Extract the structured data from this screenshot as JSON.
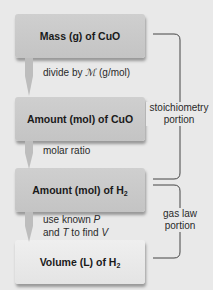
{
  "diagram": {
    "boxes": [
      {
        "label": "Mass (g) of CuO",
        "style": "dark"
      },
      {
        "label": "Amount (mol) of CuO",
        "style": "dark"
      },
      {
        "label_main": "Amount (mol) of H",
        "label_sub": "2",
        "style": "dark"
      },
      {
        "label_main": "Volume (L) of H",
        "label_sub": "2",
        "style": "light"
      }
    ],
    "steps": [
      {
        "text_pre": "divide by ",
        "symbol": "ℳ",
        "text_post": " (g/mol)"
      },
      {
        "text": "molar ratio"
      },
      {
        "line1_pre": "use known ",
        "line1_var": "P",
        "line2_pre": "and ",
        "line2_var1": "T",
        "line2_mid": " to find ",
        "line2_var2": "V"
      }
    ],
    "brackets": [
      {
        "line1": "stoichiometry",
        "line2": "portion"
      },
      {
        "line1": "gas law",
        "line2": "portion"
      }
    ],
    "colors": {
      "background": "#e9e9e9",
      "box_dark": "#c8c8c8",
      "box_light": "#e8e8e8",
      "arrow": "#bdbdbd",
      "bracket_line": "#444444"
    }
  }
}
